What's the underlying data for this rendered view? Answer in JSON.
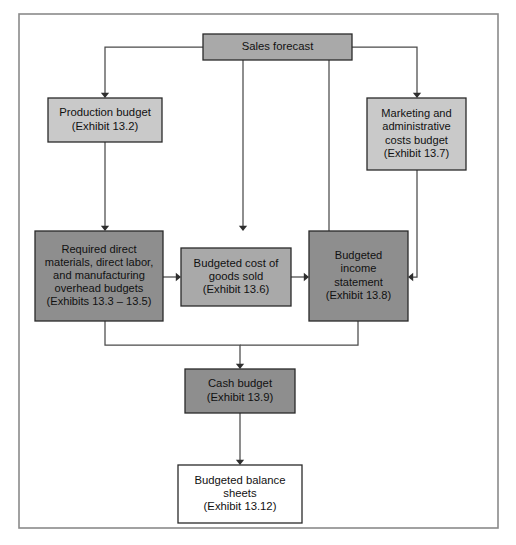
{
  "diagram": {
    "frame": {
      "x": 19,
      "y": 14,
      "width": 479,
      "height": 514,
      "border_color": "#8a8a8a"
    },
    "palette": {
      "fill_medium": "#a9a9a9",
      "fill_light": "#c9c9c9",
      "fill_dark": "#8e8e8e",
      "fill_white": "#ffffff",
      "node_border": "#2a2a2a",
      "connector": "#4a4a4a",
      "text": "#111111"
    },
    "nodes": [
      {
        "id": "sales-forecast",
        "name": "sales-forecast-node",
        "lines": [
          "Sales forecast"
        ],
        "x": 203,
        "y": 34,
        "width": 149,
        "height": 26,
        "fill": "#a9a9a9"
      },
      {
        "id": "production-budget",
        "name": "production-budget-node",
        "lines": [
          "Production budget",
          "(Exhibit 13.2)"
        ],
        "x": 48,
        "y": 98,
        "width": 114,
        "height": 44,
        "fill": "#c9c9c9"
      },
      {
        "id": "marketing-admin-costs-budget",
        "name": "marketing-admin-costs-budget-node",
        "lines": [
          "Marketing and",
          "administrative",
          "costs budget",
          "(Exhibit 13.7)"
        ],
        "x": 367,
        "y": 98,
        "width": 99,
        "height": 72,
        "fill": "#c9c9c9"
      },
      {
        "id": "required-direct-materials",
        "name": "required-direct-materials-node",
        "lines": [
          "Required direct",
          "materials, direct labor,",
          "and manufacturing",
          "overhead budgets",
          "(Exhibits 13.3 – 13.5)"
        ],
        "x": 35,
        "y": 231,
        "width": 128,
        "height": 90,
        "fill": "#8e8e8e"
      },
      {
        "id": "budgeted-cost-of-goods-sold",
        "name": "budgeted-cost-of-goods-sold-node",
        "lines": [
          "Budgeted cost of",
          "goods sold",
          "(Exhibit 13.6)"
        ],
        "x": 181,
        "y": 248,
        "width": 110,
        "height": 58,
        "fill": "#a9a9a9"
      },
      {
        "id": "budgeted-income-statement",
        "name": "budgeted-income-statement-node",
        "lines": [
          "Budgeted",
          "income",
          "statement",
          "(Exhibit 13.8)"
        ],
        "x": 309,
        "y": 231,
        "width": 99,
        "height": 90,
        "fill": "#8e8e8e"
      },
      {
        "id": "cash-budget",
        "name": "cash-budget-node",
        "lines": [
          "Cash budget",
          "(Exhibit 13.9)"
        ],
        "x": 185,
        "y": 369,
        "width": 110,
        "height": 44,
        "fill": "#8e8e8e"
      },
      {
        "id": "budgeted-balance-sheets",
        "name": "budgeted-balance-sheets-node",
        "lines": [
          "Budgeted balance",
          "sheets",
          "(Exhibit 13.12)"
        ],
        "x": 178,
        "y": 465,
        "width": 124,
        "height": 58,
        "fill": "#ffffff"
      }
    ],
    "connectors": [
      {
        "id": "sales-to-production",
        "name": "connector-sales-to-production",
        "from": "sales-forecast",
        "to": "production-budget",
        "path": "M 203 47 L 105 47 L 105 93",
        "arrow": {
          "x": 105,
          "y": 98,
          "dir": "down"
        }
      },
      {
        "id": "sales-to-required-materials",
        "name": "connector-sales-to-required-materials",
        "from": "sales-forecast",
        "to": "required-direct-materials",
        "path": "M 243 60 L 243 226",
        "arrow": {
          "x": 243,
          "y": 231,
          "dir": "down"
        }
      },
      {
        "id": "sales-to-cogs",
        "name": "connector-sales-to-cogs",
        "from": "sales-forecast",
        "to": "budgeted-cost-of-goods-sold",
        "path": "M 329 60 L 329 243",
        "arrow": {
          "x": 329,
          "y": 248,
          "dir": "down"
        }
      },
      {
        "id": "sales-to-marketing",
        "name": "connector-sales-to-marketing",
        "from": "sales-forecast",
        "to": "marketing-admin-costs-budget",
        "path": "M 352 47 L 417 47 L 417 93",
        "arrow": {
          "x": 417,
          "y": 98,
          "dir": "down"
        }
      },
      {
        "id": "production-to-required-materials",
        "name": "connector-production-to-required-materials",
        "from": "production-budget",
        "to": "required-direct-materials",
        "path": "M 105 142 L 105 226",
        "arrow": {
          "x": 105,
          "y": 231,
          "dir": "down"
        }
      },
      {
        "id": "required-materials-to-cogs",
        "name": "connector-required-materials-to-cogs",
        "from": "required-direct-materials",
        "to": "budgeted-cost-of-goods-sold",
        "path": "M 163 277 L 176 277",
        "arrow": {
          "x": 181,
          "y": 277,
          "dir": "right"
        }
      },
      {
        "id": "cogs-to-income-statement",
        "name": "connector-cogs-to-income-statement",
        "from": "budgeted-cost-of-goods-sold",
        "to": "budgeted-income-statement",
        "path": "M 291 277 L 304 277",
        "arrow": {
          "x": 309,
          "y": 277,
          "dir": "right"
        }
      },
      {
        "id": "marketing-to-income-statement",
        "name": "connector-marketing-to-income-statement",
        "from": "marketing-admin-costs-budget",
        "to": "budgeted-income-statement",
        "path": "M 417 170 L 417 277 L 413 277",
        "arrow": {
          "x": 408,
          "y": 277,
          "dir": "left"
        }
      },
      {
        "id": "required-materials-to-cash",
        "name": "connector-required-materials-to-cash",
        "from": "required-direct-materials",
        "to": "cash-budget",
        "path": "M 105 321 L 105 345 L 240 345 L 240 364",
        "arrow": {
          "x": 240,
          "y": 369,
          "dir": "down"
        }
      },
      {
        "id": "income-statement-to-cash",
        "name": "connector-income-statement-to-cash",
        "from": "budgeted-income-statement",
        "to": "cash-budget",
        "path": "M 358 321 L 358 345 L 240 345",
        "arrow": null
      },
      {
        "id": "cash-to-balance-sheets",
        "name": "connector-cash-to-balance-sheets",
        "from": "cash-budget",
        "to": "budgeted-balance-sheets",
        "path": "M 240 413 L 240 460",
        "arrow": {
          "x": 240,
          "y": 465,
          "dir": "down"
        }
      }
    ]
  }
}
